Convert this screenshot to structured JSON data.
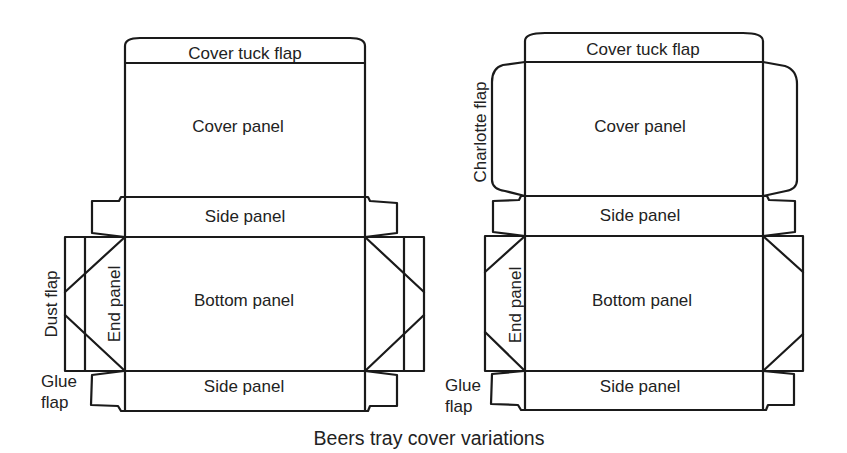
{
  "caption": "Beers tray cover variations",
  "colors": {
    "line": "#1a1a1a",
    "text": "#222222",
    "background": "#ffffff"
  },
  "left_variant": {
    "cover_tuck_flap": "Cover tuck flap",
    "cover_panel": "Cover panel",
    "side_panel_top": "Side panel",
    "bottom_panel": "Bottom panel",
    "side_panel_bottom": "Side panel",
    "end_panel": "End panel",
    "dust_flap": "Dust flap",
    "glue_flap_line1": "Glue",
    "glue_flap_line2": "flap"
  },
  "right_variant": {
    "cover_tuck_flap": "Cover tuck flap",
    "cover_panel": "Cover panel",
    "charlotte_flap": "Charlotte flap",
    "side_panel_top": "Side panel",
    "bottom_panel": "Bottom panel",
    "side_panel_bottom": "Side panel",
    "end_panel": "End panel",
    "glue_flap_line1": "Glue",
    "glue_flap_line2": "flap"
  }
}
